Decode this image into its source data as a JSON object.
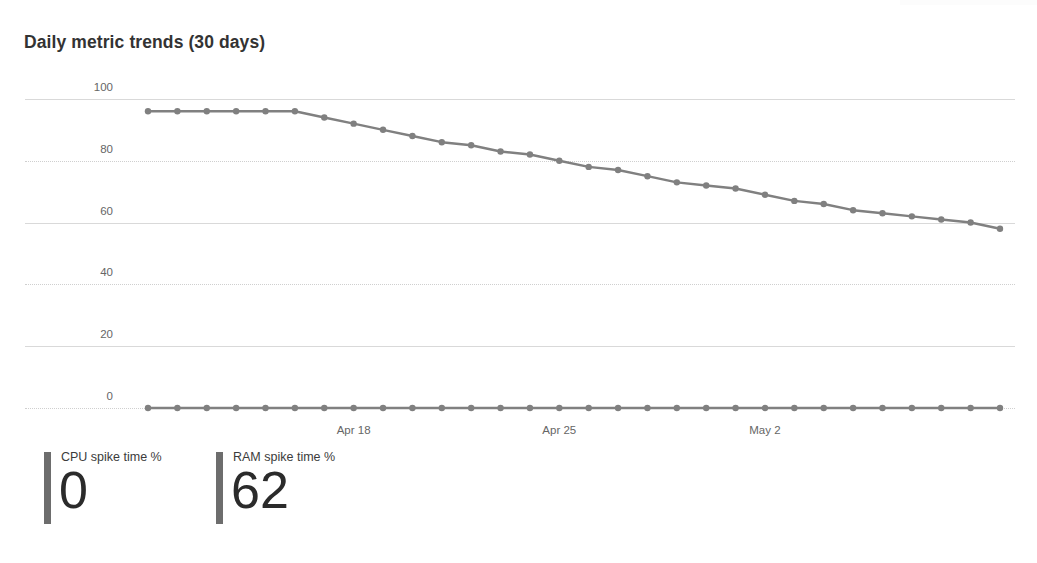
{
  "chart_card": {
    "title": "Daily metric trends (30 days)"
  },
  "kpis": [
    {
      "label": "CPU spike time %",
      "value": "0",
      "accent": "#6d6d6d",
      "left": 44
    },
    {
      "label": "RAM spike time %",
      "value": "62",
      "accent": "#6d6d6d",
      "left": 216
    }
  ],
  "chart_data": {
    "type": "line",
    "title": "Daily metric trends (30 days)",
    "xlabel": "",
    "ylabel": "",
    "ylim": [
      0,
      110
    ],
    "yticks": [
      0,
      20,
      40,
      60,
      80,
      100
    ],
    "ytick_labels": [
      "0",
      "20",
      "40",
      "60",
      "80",
      "100"
    ],
    "grid": true,
    "legend": false,
    "x": [
      "Apr 11",
      "Apr 12",
      "Apr 13",
      "Apr 14",
      "Apr 15",
      "Apr 16",
      "Apr 17",
      "Apr 18",
      "Apr 19",
      "Apr 20",
      "Apr 21",
      "Apr 22",
      "Apr 23",
      "Apr 24",
      "Apr 25",
      "Apr 26",
      "Apr 27",
      "Apr 28",
      "Apr 29",
      "Apr 30",
      "May 1",
      "May 2",
      "May 3",
      "May 4",
      "May 5",
      "May 6",
      "May 7",
      "May 8",
      "May 9",
      "May 10"
    ],
    "xtick_labels": [
      "Apr 18",
      "Apr 25",
      "May 2"
    ],
    "xtick_indices": [
      7,
      14,
      21
    ],
    "series": [
      {
        "name": "RAM spike time %",
        "color": "#808080",
        "values": [
          96,
          96,
          96,
          96,
          96,
          96,
          94,
          92,
          90,
          88,
          86,
          85,
          83,
          82,
          80,
          78,
          77,
          75,
          73,
          72,
          71,
          69,
          67,
          66,
          64,
          63,
          62,
          61,
          60,
          58
        ]
      },
      {
        "name": "CPU spike time %",
        "color": "#808080",
        "values": [
          0,
          0,
          0,
          0,
          0,
          0,
          0,
          0,
          0,
          0,
          0,
          0,
          0,
          0,
          0,
          0,
          0,
          0,
          0,
          0,
          0,
          0,
          0,
          0,
          0,
          0,
          0,
          0,
          0,
          0
        ]
      }
    ]
  }
}
